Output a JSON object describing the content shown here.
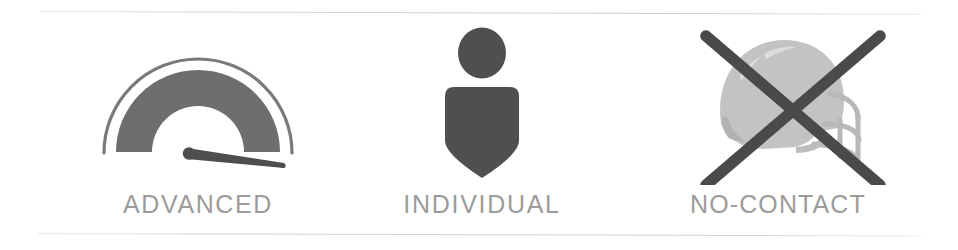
{
  "strip": {
    "background_color": "#ffffff",
    "rule_color": "#d0d0d0",
    "label_color": "#9b9b9b",
    "icon_dark_color": "#585858",
    "icon_mid_color": "#6e6e6e",
    "icon_light_color": "#c2c2c2"
  },
  "items": [
    {
      "id": "advanced",
      "label": "ADVANCED",
      "icon": "gauge-icon",
      "icon_description": "semicircular gauge dial with needle"
    },
    {
      "id": "individual",
      "label": "INDIVIDUAL",
      "icon": "person-shield-icon",
      "icon_description": "person head over shield shaped body"
    },
    {
      "id": "no-contact",
      "label": "NO-CONTACT",
      "icon": "helmet-crossed-out-icon",
      "icon_description": "football helmet crossed out with an X"
    }
  ]
}
